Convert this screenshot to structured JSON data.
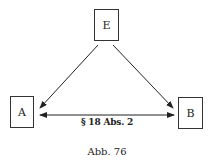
{
  "diagram": {
    "nodes": [
      {
        "id": "E",
        "label": "E"
      },
      {
        "id": "A",
        "label": "A"
      },
      {
        "id": "B",
        "label": "B"
      }
    ],
    "edges": [
      {
        "from": "E",
        "to": "A",
        "label": ""
      },
      {
        "from": "E",
        "to": "B",
        "label": ""
      },
      {
        "from": "A",
        "to": "B",
        "label": "§ 18 Abs. 2",
        "bidirectional": true
      }
    ],
    "caption": "Abb. 76"
  }
}
